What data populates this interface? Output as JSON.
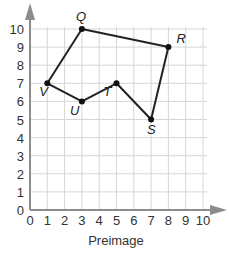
{
  "chart_data": {
    "type": "scatter",
    "title": "",
    "xlabel": "Preimage",
    "ylabel": "",
    "xlim": [
      0,
      10
    ],
    "ylim": [
      0,
      10
    ],
    "grid": true,
    "x_ticks": [
      "0",
      "1",
      "2",
      "3",
      "4",
      "5",
      "6",
      "7",
      "8",
      "9",
      "10"
    ],
    "y_ticks": [
      "0",
      "1",
      "2",
      "3",
      "4",
      "5",
      "6",
      "7",
      "8",
      "9",
      "10"
    ],
    "polygon": {
      "closed": true,
      "order": [
        "Q",
        "R",
        "S",
        "T",
        "U",
        "V"
      ],
      "points": [
        {
          "label": "Q",
          "x": 3,
          "y": 10
        },
        {
          "label": "R",
          "x": 8,
          "y": 9
        },
        {
          "label": "S",
          "x": 7,
          "y": 5
        },
        {
          "label": "T",
          "x": 5,
          "y": 7
        },
        {
          "label": "U",
          "x": 3,
          "y": 6
        },
        {
          "label": "V",
          "x": 1,
          "y": 7
        }
      ]
    },
    "colors": {
      "grid": "#d6d6d6",
      "axis": "#8c8c8c",
      "line": "#222222",
      "point": "#111111"
    }
  }
}
